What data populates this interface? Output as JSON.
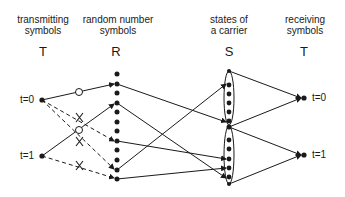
{
  "columns": [
    {
      "id": "transmit",
      "header": "transmitting\nsymbols",
      "symbol": "T"
    },
    {
      "id": "random",
      "header": "random number\nsymbols",
      "symbol": "R"
    },
    {
      "id": "carrier",
      "header": "states of\na carrier",
      "symbol": "S"
    },
    {
      "id": "receive",
      "header": "receiving\nsymbols",
      "symbol": "T"
    }
  ],
  "transmit_labels": [
    "t=0",
    "t=1"
  ],
  "receive_labels": [
    "t=0",
    "t=1"
  ],
  "markers": {
    "accepted": "O",
    "rejected": "X"
  },
  "random_dot_count": 12,
  "carrier_groups": [
    {
      "name": "upper-group",
      "dot_count": 5
    },
    {
      "name": "lower-group",
      "dot_count": 5
    }
  ]
}
